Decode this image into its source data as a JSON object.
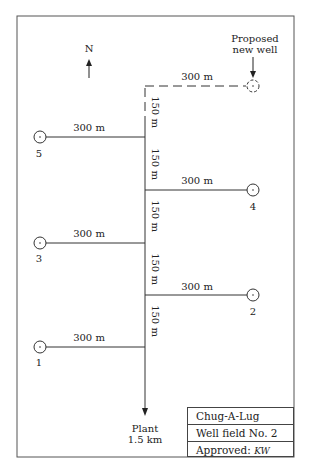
{
  "compass": {
    "label": "N"
  },
  "proposed_well": {
    "label_line1": "Proposed",
    "label_line2": "new well",
    "distance": "300 m"
  },
  "trunk_segments": [
    "150 m",
    "150 m",
    "150 m",
    "150 m",
    "150 m"
  ],
  "wells": [
    {
      "id": "5",
      "side": "west",
      "distance": "300 m"
    },
    {
      "id": "4",
      "side": "east",
      "distance": "300 m"
    },
    {
      "id": "3",
      "side": "west",
      "distance": "300 m"
    },
    {
      "id": "2",
      "side": "east",
      "distance": "300 m"
    },
    {
      "id": "1",
      "side": "west",
      "distance": "300 m"
    }
  ],
  "destination": {
    "line1": "Plant",
    "line2": "1.5 km"
  },
  "title_block": {
    "project": "Chug-A-Lug",
    "field": "Well field No. 2",
    "approved_label": "Approved:",
    "approved_sig": "KW"
  }
}
